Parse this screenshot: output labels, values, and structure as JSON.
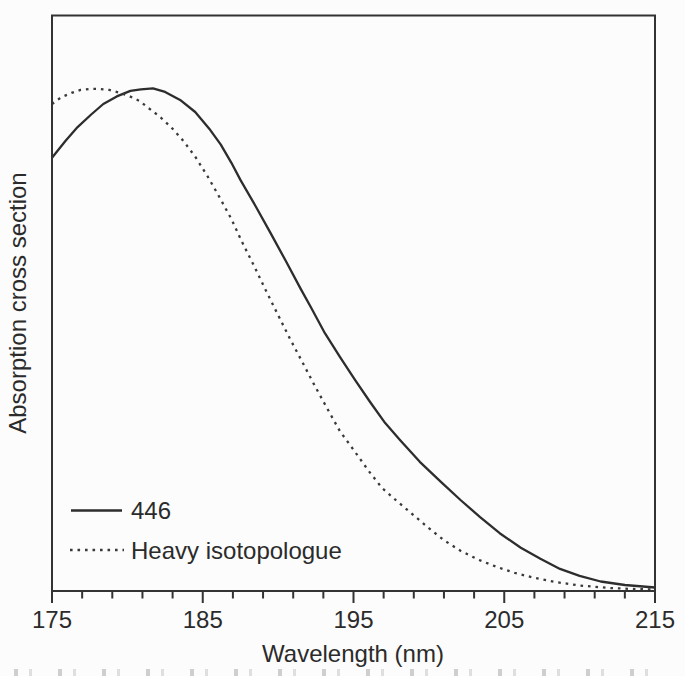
{
  "figure": {
    "background": "#fcfcfc",
    "frame_color": "#333333",
    "text_color": "#2b2b2b"
  },
  "chart_data": {
    "type": "line",
    "title": "",
    "xlabel": "Wavelength (nm)",
    "ylabel": "Absorption cross section",
    "xlim": [
      175,
      215
    ],
    "ylim": [
      0,
      1.146
    ],
    "x_major_ticks": [
      175,
      185,
      195,
      205,
      215
    ],
    "x_minor_tick_step": 2,
    "y_ticks": [],
    "grid": false,
    "legend_position": "lower-left-inside",
    "legend": {
      "items": [
        {
          "label": "446",
          "style": "solid"
        },
        {
          "label": "Heavy isotopologue",
          "style": "dotted"
        }
      ]
    },
    "series": [
      {
        "name": "446",
        "style": "solid",
        "color": "#2d2d2d",
        "points": [
          [
            175.0,
            0.862
          ],
          [
            175.9,
            0.896
          ],
          [
            176.7,
            0.923
          ],
          [
            177.6,
            0.948
          ],
          [
            178.4,
            0.969
          ],
          [
            179.3,
            0.984
          ],
          [
            180.2,
            0.995
          ],
          [
            180.9,
            0.998
          ],
          [
            181.7,
            1.0
          ],
          [
            182.5,
            0.993
          ],
          [
            183.5,
            0.977
          ],
          [
            184.5,
            0.953
          ],
          [
            185.5,
            0.917
          ],
          [
            186.2,
            0.888
          ],
          [
            186.9,
            0.852
          ],
          [
            187.5,
            0.818
          ],
          [
            188.5,
            0.766
          ],
          [
            189.5,
            0.712
          ],
          [
            190.5,
            0.657
          ],
          [
            191.5,
            0.601
          ],
          [
            192.2,
            0.563
          ],
          [
            193.1,
            0.513
          ],
          [
            194.1,
            0.466
          ],
          [
            195.1,
            0.42
          ],
          [
            196.1,
            0.376
          ],
          [
            197.1,
            0.334
          ],
          [
            198.1,
            0.3
          ],
          [
            199.4,
            0.257
          ],
          [
            200.8,
            0.217
          ],
          [
            202.1,
            0.181
          ],
          [
            203.4,
            0.147
          ],
          [
            204.7,
            0.115
          ],
          [
            206.1,
            0.086
          ],
          [
            207.4,
            0.064
          ],
          [
            208.7,
            0.044
          ],
          [
            210.0,
            0.03
          ],
          [
            211.4,
            0.019
          ],
          [
            213.0,
            0.012
          ],
          [
            215.0,
            0.007
          ]
        ]
      },
      {
        "name": "Heavy isotopologue",
        "style": "dotted",
        "color": "#3a3a3a",
        "points": [
          [
            175.0,
            0.969
          ],
          [
            175.6,
            0.982
          ],
          [
            176.3,
            0.991
          ],
          [
            176.9,
            0.997
          ],
          [
            177.6,
            0.999
          ],
          [
            178.1,
            0.999
          ],
          [
            178.8,
            0.997
          ],
          [
            179.4,
            0.992
          ],
          [
            180.1,
            0.985
          ],
          [
            180.8,
            0.975
          ],
          [
            181.4,
            0.961
          ],
          [
            182.1,
            0.945
          ],
          [
            182.9,
            0.923
          ],
          [
            183.7,
            0.896
          ],
          [
            184.5,
            0.864
          ],
          [
            185.3,
            0.826
          ],
          [
            186.1,
            0.784
          ],
          [
            186.9,
            0.74
          ],
          [
            187.6,
            0.695
          ],
          [
            188.4,
            0.647
          ],
          [
            189.2,
            0.597
          ],
          [
            190.0,
            0.549
          ],
          [
            190.8,
            0.501
          ],
          [
            191.6,
            0.456
          ],
          [
            192.4,
            0.41
          ],
          [
            193.2,
            0.366
          ],
          [
            194.1,
            0.318
          ],
          [
            195.1,
            0.277
          ],
          [
            196.0,
            0.239
          ],
          [
            196.9,
            0.205
          ],
          [
            197.8,
            0.181
          ],
          [
            198.9,
            0.153
          ],
          [
            200.0,
            0.125
          ],
          [
            201.0,
            0.101
          ],
          [
            202.1,
            0.08
          ],
          [
            203.3,
            0.062
          ],
          [
            204.5,
            0.048
          ],
          [
            205.7,
            0.036
          ],
          [
            207.0,
            0.026
          ],
          [
            208.4,
            0.018
          ],
          [
            210.0,
            0.011
          ],
          [
            212.0,
            0.006
          ],
          [
            213.5,
            0.004
          ],
          [
            215.0,
            0.003
          ]
        ]
      }
    ]
  }
}
